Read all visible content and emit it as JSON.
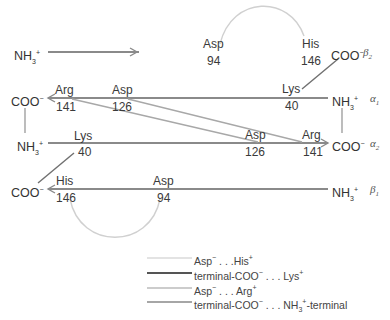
{
  "diagram": {
    "chains": [
      {
        "id": "beta2",
        "label": "β2",
        "start": "NH3+",
        "end": "COO−",
        "direction": "right",
        "y": 73
      },
      {
        "id": "alpha1",
        "label": "α1",
        "start": "NH3+",
        "end": "COO−",
        "direction": "left",
        "y": 98
      },
      {
        "id": "alpha2",
        "label": "α2",
        "start": "NH3+",
        "end": "COO−",
        "direction": "right",
        "y": 143
      },
      {
        "id": "beta1",
        "label": "β1",
        "start": "NH3+",
        "end": "COO−",
        "direction": "left",
        "y": 189
      }
    ],
    "residues": {
      "beta2_asp": {
        "name": "Asp",
        "num": "94"
      },
      "beta2_his": {
        "name": "His",
        "num": "146"
      },
      "alpha1_arg": {
        "name": "Arg",
        "num": "141"
      },
      "alpha1_asp": {
        "name": "Asp",
        "num": "126"
      },
      "alpha1_lys": {
        "name": "Lys",
        "num": "40"
      },
      "alpha2_lys": {
        "name": "Lys",
        "num": "40"
      },
      "alpha2_asp": {
        "name": "Asp",
        "num": "126"
      },
      "alpha2_arg": {
        "name": "Arg",
        "num": "141"
      },
      "beta1_his": {
        "name": "His",
        "num": "146"
      },
      "beta1_asp": {
        "name": "Asp",
        "num": "94"
      }
    },
    "terminals": {
      "nh3": "NH",
      "nh3_sub": "3",
      "nh3_sup": "+",
      "coo": "COO",
      "coo_sup": "−"
    },
    "chain_labels": {
      "beta2": "β",
      "beta2_sub": "2",
      "alpha1": "α",
      "alpha1_sub": "1",
      "alpha2": "α",
      "alpha2_sub": "2",
      "beta1": "β",
      "beta1_sub": "1"
    }
  },
  "legend": {
    "items": [
      {
        "text_a": "Asp",
        "sup_a": "−",
        "mid": " . . .His",
        "sup_b": "+",
        "tail": "",
        "style": "thin-light",
        "color": "#c8c8c8"
      },
      {
        "text_a": "terminal-COO",
        "sup_a": "−",
        "mid": " . . . Lys",
        "sup_b": "+",
        "tail": "",
        "style": "thick-dark",
        "color": "#555555"
      },
      {
        "text_a": "Asp",
        "sup_a": "−",
        "mid": " . . . Arg",
        "sup_b": "+",
        "tail": "",
        "style": "medium-gray",
        "color": "#9a9a9a"
      },
      {
        "text_a": "terminal-COO",
        "sup_a": "−",
        "mid": " . . . NH",
        "sub": "3",
        "sup_b": "+",
        "tail": "-terminal",
        "style": "medium",
        "color": "#888888"
      }
    ]
  },
  "colors": {
    "chain_line": "#8a8a8a",
    "salt_bridge_his": "#cfcfcf",
    "salt_bridge_lys": "#707070",
    "salt_bridge_arg": "#a8a8a8",
    "terminal_link": "#999999"
  }
}
